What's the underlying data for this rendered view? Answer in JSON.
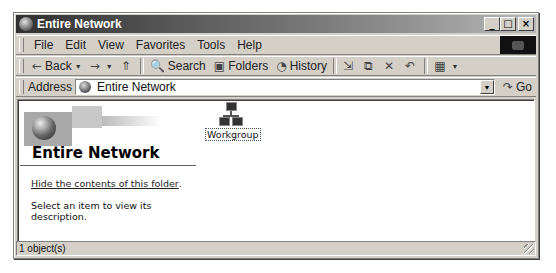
{
  "window": {
    "title": "Entire Network",
    "controls": {
      "minimize": "_",
      "maximize": "□",
      "close": "×"
    }
  },
  "menubar": {
    "items": [
      {
        "label": "File",
        "accel": "F"
      },
      {
        "label": "Edit",
        "accel": "E"
      },
      {
        "label": "View",
        "accel": "V"
      },
      {
        "label": "Favorites",
        "accel": "a"
      },
      {
        "label": "Tools",
        "accel": "T"
      },
      {
        "label": "Help",
        "accel": "H"
      }
    ]
  },
  "toolbar": {
    "back_label": "Back",
    "search_label": "Search",
    "folders_label": "Folders",
    "history_label": "History",
    "icons": {
      "back": "←",
      "forward": "→",
      "up": "⇑",
      "search": "🔍",
      "folders": "▣",
      "history": "◔",
      "move_to": "⇲",
      "copy_to": "⧉",
      "delete": "✕",
      "undo": "↶",
      "views": "▦",
      "dropdown": "▼"
    }
  },
  "addressbar": {
    "label": "Address",
    "value": "Entire Network",
    "go_label": "Go",
    "go_icon": "↷"
  },
  "webview": {
    "title": "Entire Network",
    "hide_link": "Hide the contents of this folder",
    "hide_suffix": ".",
    "description": "Select an item to view its description."
  },
  "items": [
    {
      "label": "Workgroup",
      "icon": "network-workgroup"
    }
  ],
  "statusbar": {
    "text": "1 object(s)"
  }
}
